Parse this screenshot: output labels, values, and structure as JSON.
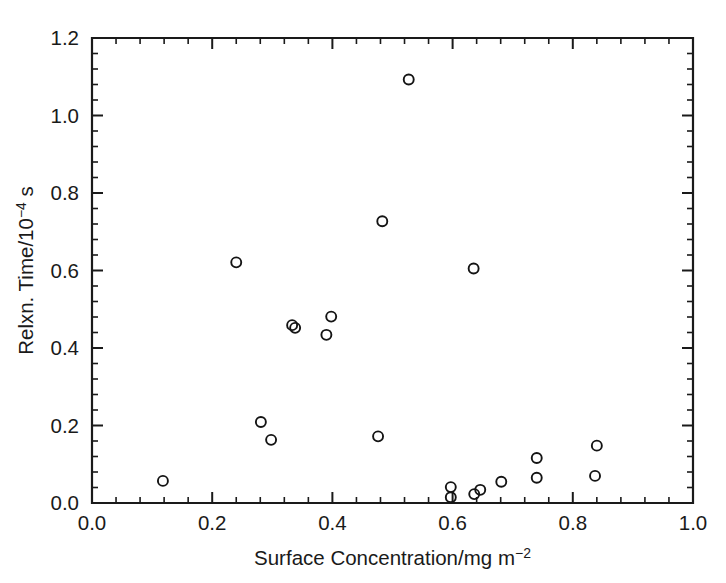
{
  "figure": {
    "background_color": "#ffffff",
    "ink_color": "#1a1a1a",
    "marker_shape": "open-circle",
    "marker_radius_px": 5
  },
  "chart_data": {
    "type": "scatter",
    "title": "",
    "subtitle": "",
    "xlabel": "Surface Concentration/mg m−2",
    "ylabel": "Relxn. Time/10−4 s",
    "xlabel_plain": "Surface Concentration/mg m",
    "xlabel_exponent": "−2",
    "ylabel_plain_a": "Relxn. Time/10",
    "ylabel_exponent": "−4",
    "ylabel_plain_b": " s",
    "xlim": [
      0.0,
      1.0
    ],
    "ylim": [
      0.0,
      1.2
    ],
    "xticks": [
      0.0,
      0.2,
      0.4,
      0.6,
      0.8,
      1.0
    ],
    "yticks": [
      0.0,
      0.2,
      0.4,
      0.6,
      0.8,
      1.0,
      1.2
    ],
    "xtick_labels": [
      "0.0",
      "0.2",
      "0.4",
      "0.6",
      "0.8",
      "1.0"
    ],
    "ytick_labels": [
      "0.0",
      "0.2",
      "0.4",
      "0.6",
      "0.8",
      "1.0",
      "1.2"
    ],
    "x_minor_ticks_per_interval": 4,
    "y_minor_ticks_per_interval": 4,
    "grid": false,
    "legend": false,
    "legend_position": "none",
    "series_name": "Relaxation time vs surface concentration",
    "points": [
      {
        "x": 0.118,
        "y": 0.057
      },
      {
        "x": 0.24,
        "y": 0.621
      },
      {
        "x": 0.281,
        "y": 0.209
      },
      {
        "x": 0.298,
        "y": 0.163
      },
      {
        "x": 0.333,
        "y": 0.459
      },
      {
        "x": 0.338,
        "y": 0.452
      },
      {
        "x": 0.39,
        "y": 0.434
      },
      {
        "x": 0.398,
        "y": 0.481
      },
      {
        "x": 0.476,
        "y": 0.172
      },
      {
        "x": 0.483,
        "y": 0.727
      },
      {
        "x": 0.527,
        "y": 1.093
      },
      {
        "x": 0.597,
        "y": 0.041
      },
      {
        "x": 0.597,
        "y": 0.015
      },
      {
        "x": 0.636,
        "y": 0.023
      },
      {
        "x": 0.646,
        "y": 0.034
      },
      {
        "x": 0.635,
        "y": 0.605
      },
      {
        "x": 0.681,
        "y": 0.055
      },
      {
        "x": 0.74,
        "y": 0.116
      },
      {
        "x": 0.74,
        "y": 0.065
      },
      {
        "x": 0.84,
        "y": 0.148
      },
      {
        "x": 0.837,
        "y": 0.07
      }
    ]
  },
  "artifacts": {
    "top_smudge": ""
  }
}
